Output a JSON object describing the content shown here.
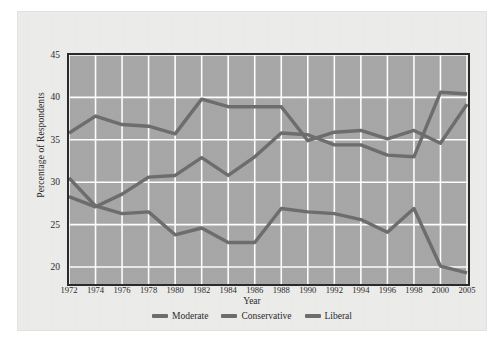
{
  "figure": {
    "background_color": "#ededeb",
    "plot_background_color": "#a8a8a8",
    "grid_color": "#ffffff",
    "frame_color": "#2a2a2a"
  },
  "chart_data": {
    "type": "line",
    "title": "",
    "xlabel": "Year",
    "ylabel": "Percentage of Respondents",
    "x": [
      "1972",
      "1974",
      "1976",
      "1978",
      "1980",
      "1982",
      "1984",
      "1986",
      "1988",
      "1990",
      "1992",
      "1994",
      "1996",
      "1998",
      "2000",
      "2005"
    ],
    "xtick_labels": [
      "1972",
      "1974",
      "1976",
      "1978",
      "1980",
      "1982",
      "1984",
      "1986",
      "1988",
      "1990",
      "1992",
      "1994",
      "1996",
      "1998",
      "2000",
      "2005"
    ],
    "ytick_labels": [
      "20",
      "25",
      "30",
      "35",
      "40",
      "45"
    ],
    "ylim": [
      18.0,
      45.0
    ],
    "ytick_values": [
      20,
      25,
      30,
      35,
      40,
      45
    ],
    "grid": true,
    "legend_position": "bottom-center",
    "series": [
      {
        "name": "Moderate",
        "color": "#6e6e6e",
        "values": [
          35.8,
          37.8,
          36.8,
          36.6,
          35.7,
          39.8,
          38.9,
          38.9,
          38.9,
          34.9,
          35.9,
          36.1,
          35.1,
          36.1,
          34.6,
          39.2
        ]
      },
      {
        "name": "Conservative",
        "color": "#6e6e6e",
        "values": [
          28.3,
          27.1,
          28.6,
          30.6,
          30.8,
          32.9,
          30.8,
          33.0,
          35.8,
          35.6,
          34.4,
          34.4,
          33.2,
          33.0,
          40.6,
          40.4
        ]
      },
      {
        "name": "Liberal",
        "color": "#6e6e6e",
        "values": [
          30.5,
          27.2,
          26.3,
          26.5,
          23.8,
          24.6,
          22.9,
          22.9,
          26.9,
          26.5,
          26.3,
          25.6,
          24.1,
          26.9,
          20.1,
          19.3
        ]
      }
    ]
  },
  "legend": {
    "items": [
      {
        "label": "Moderate",
        "color": "#6e6e6e"
      },
      {
        "label": "Conservative",
        "color": "#6e6e6e"
      },
      {
        "label": "Liberal",
        "color": "#6e6e6e"
      }
    ]
  }
}
